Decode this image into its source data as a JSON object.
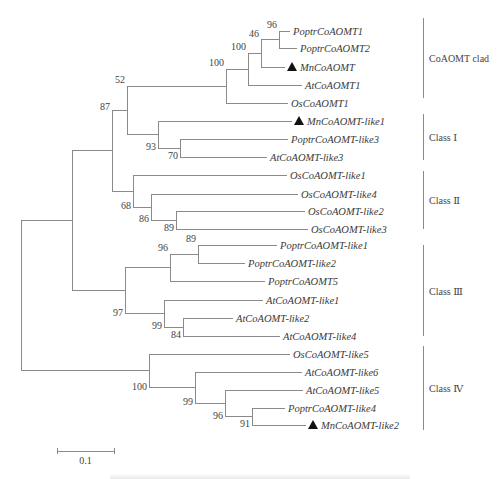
{
  "tree": {
    "type": "phylogenetic-tree",
    "line_color": "#8a8a8a",
    "marker_color": "#111111",
    "leaves": [
      {
        "id": "l0",
        "label": "PoptrCoAOMT1",
        "y": 31,
        "x_end": 290,
        "marker": false
      },
      {
        "id": "l1",
        "label": "PoptrCoAOMT2",
        "y": 48,
        "x_end": 297,
        "marker": false
      },
      {
        "id": "l2",
        "label": "MnCoAOMT",
        "y": 67,
        "x_end": 285,
        "marker": true
      },
      {
        "id": "l3",
        "label": "AtCoAOMT1",
        "y": 85,
        "x_end": 302,
        "marker": false
      },
      {
        "id": "l4",
        "label": "OsCoAOMT1",
        "y": 103,
        "x_end": 288,
        "marker": false
      },
      {
        "id": "l5",
        "label": "MnCoAOMT-like1",
        "y": 121,
        "x_end": 292,
        "marker": true
      },
      {
        "id": "l6",
        "label": "PoptrCoAOMT-like3",
        "y": 139,
        "x_end": 288,
        "marker": false
      },
      {
        "id": "l7",
        "label": "AtCoAOMT-like3",
        "y": 157,
        "x_end": 267,
        "marker": false
      },
      {
        "id": "l8",
        "label": "OsCoAOMT-like1",
        "y": 175,
        "x_end": 287,
        "marker": false
      },
      {
        "id": "l9",
        "label": "OsCoAOMT-like4",
        "y": 194,
        "x_end": 298,
        "marker": false
      },
      {
        "id": "l10",
        "label": "OsCoAOMT-like2",
        "y": 211,
        "x_end": 305,
        "marker": false
      },
      {
        "id": "l11",
        "label": "OsCoAOMT-like3",
        "y": 229,
        "x_end": 308,
        "marker": false
      },
      {
        "id": "l12",
        "label": "PoptrCoAOMT-like1",
        "y": 245,
        "x_end": 277,
        "marker": false
      },
      {
        "id": "l13",
        "label": "PoptrCoAOMT-like2",
        "y": 263,
        "x_end": 245,
        "marker": false
      },
      {
        "id": "l14",
        "label": "PoptrCoAOMT5",
        "y": 281,
        "x_end": 265,
        "marker": false
      },
      {
        "id": "l15",
        "label": "AtCoAOMT-like1",
        "y": 300,
        "x_end": 263,
        "marker": false
      },
      {
        "id": "l16",
        "label": "AtCoAOMT-like2",
        "y": 318,
        "x_end": 233,
        "marker": false
      },
      {
        "id": "l17",
        "label": "AtCoAOMT-like4",
        "y": 336,
        "x_end": 280,
        "marker": false
      },
      {
        "id": "l18",
        "label": "OsCoAOMT-like5",
        "y": 354,
        "x_end": 290,
        "marker": false
      },
      {
        "id": "l19",
        "label": "AtCoAOMT-like6",
        "y": 372,
        "x_end": 302,
        "marker": false
      },
      {
        "id": "l20",
        "label": "AtCoAOMT-like5",
        "y": 390,
        "x_end": 303,
        "marker": false
      },
      {
        "id": "l21",
        "label": "PoptrCoAOMT-like4",
        "y": 408,
        "x_end": 285,
        "marker": false
      },
      {
        "id": "l22",
        "label": "MnCoAOMT-like2",
        "y": 425,
        "x_end": 306,
        "marker": true
      }
    ],
    "internal_nodes": [
      {
        "id": "n96a",
        "x": 279,
        "children": [
          "l0",
          "l1"
        ],
        "bootstrap": "96"
      },
      {
        "id": "n46",
        "x": 261,
        "children": [
          "n96a",
          "l2"
        ],
        "bootstrap": "46"
      },
      {
        "id": "n100b",
        "x": 248,
        "children": [
          "n46",
          "l3"
        ],
        "bootstrap": "100"
      },
      {
        "id": "n100a",
        "x": 226,
        "children": [
          "n100b",
          "l4"
        ],
        "bootstrap": "100"
      },
      {
        "id": "n70",
        "x": 180,
        "children": [
          "l6",
          "l7"
        ],
        "bootstrap": "70"
      },
      {
        "id": "n93",
        "x": 158,
        "children": [
          "l5",
          "n70"
        ],
        "bootstrap": "93"
      },
      {
        "id": "n52",
        "x": 127,
        "children": [
          "n100a",
          "n93"
        ],
        "bootstrap": "52"
      },
      {
        "id": "n89a",
        "x": 176,
        "children": [
          "l10",
          "l11"
        ],
        "bootstrap": "89"
      },
      {
        "id": "n86",
        "x": 151,
        "children": [
          "l9",
          "n89a"
        ],
        "bootstrap": "86"
      },
      {
        "id": "n68",
        "x": 133,
        "children": [
          "l8",
          "n86"
        ],
        "bootstrap": "68"
      },
      {
        "id": "n87",
        "x": 112,
        "children": [
          "n52",
          "n68"
        ],
        "bootstrap": "87"
      },
      {
        "id": "n89b",
        "x": 198,
        "children": [
          "l12",
          "l13"
        ],
        "bootstrap": "89"
      },
      {
        "id": "n96b",
        "x": 170,
        "children": [
          "n89b",
          "l14"
        ],
        "bootstrap": "96"
      },
      {
        "id": "n84",
        "x": 183,
        "children": [
          "l16",
          "l17"
        ],
        "bootstrap": "84"
      },
      {
        "id": "n99a",
        "x": 164,
        "children": [
          "l15",
          "n84"
        ],
        "bootstrap": "99"
      },
      {
        "id": "n97",
        "x": 125,
        "children": [
          "n96b",
          "n99a"
        ],
        "bootstrap": "97"
      },
      {
        "id": "nUpper",
        "x": 72,
        "children": [
          "n87",
          "n97"
        ],
        "bootstrap": ""
      },
      {
        "id": "n91",
        "x": 252,
        "children": [
          "l21",
          "l22"
        ],
        "bootstrap": "91"
      },
      {
        "id": "n96c",
        "x": 225,
        "children": [
          "l20",
          "n91"
        ],
        "bootstrap": "96"
      },
      {
        "id": "n99b",
        "x": 195,
        "children": [
          "l19",
          "n96c"
        ],
        "bootstrap": "99"
      },
      {
        "id": "n100c",
        "x": 149,
        "children": [
          "l18",
          "n99b"
        ],
        "bootstrap": "100"
      },
      {
        "id": "root",
        "x": 21,
        "children": [
          "nUpper",
          "n100c"
        ],
        "bootstrap": ""
      }
    ],
    "clades": [
      {
        "label": "CoAOMT clad",
        "y_top": 18,
        "y_bottom": 98,
        "x": 423
      },
      {
        "label": "Class Ⅰ",
        "y_top": 114,
        "y_bottom": 160,
        "x": 423
      },
      {
        "label": "Class Ⅱ",
        "y_top": 171,
        "y_bottom": 229,
        "x": 423
      },
      {
        "label": "Class Ⅲ",
        "y_top": 245,
        "y_bottom": 336,
        "x": 423
      },
      {
        "label": "Class Ⅳ",
        "y_top": 346,
        "y_bottom": 430,
        "x": 423
      }
    ],
    "scale_bar": {
      "label": "0.1",
      "x1": 57,
      "x2": 114,
      "y": 451
    }
  },
  "caption": {
    "visible": "cut off / illegible"
  }
}
